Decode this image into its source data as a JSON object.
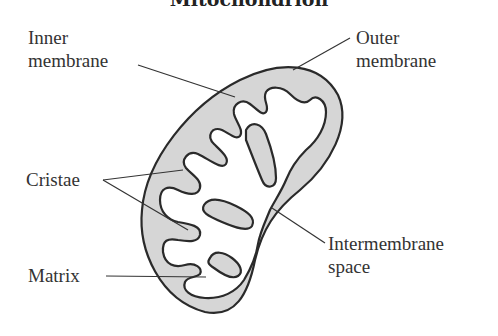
{
  "title": "Mitochondrion",
  "labels": {
    "inner_membrane": [
      "Inner",
      "membrane"
    ],
    "outer_membrane": [
      "Outer",
      "membrane"
    ],
    "cristae": "Cristae",
    "matrix": "Matrix",
    "intermembrane_space": [
      "Intermembrane",
      "space"
    ]
  },
  "colors": {
    "membrane_fill": "#d6d6d6",
    "matrix_fill": "#ffffff",
    "stroke": "#2a2a2a"
  }
}
